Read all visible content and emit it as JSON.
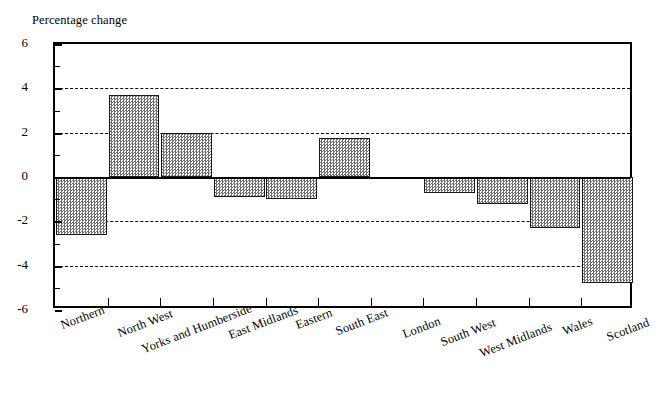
{
  "chart_data": {
    "type": "bar",
    "title": "",
    "ylabel": "Percentage change",
    "xlabel": "",
    "ylim": [
      -6,
      6
    ],
    "ytick_labels": [
      "6",
      "4",
      "2",
      "0",
      "-2",
      "-4",
      "-6"
    ],
    "ytick_values": [
      6,
      4,
      2,
      0,
      -2,
      -4,
      -6
    ],
    "yminor_ticks": [
      5,
      3,
      1,
      -1,
      -3,
      -5
    ],
    "gridlines": [
      4,
      2,
      -2,
      -4
    ],
    "grid": true,
    "grid_style": "dashed",
    "zero_line": 0,
    "legend": "none",
    "categories": [
      "Northern",
      "North West",
      "Yorks and Humberside",
      "East Midlands",
      "Eastern",
      "South East",
      "London",
      "South West",
      "West Midlands",
      "Wales",
      "Scotland"
    ],
    "values": [
      -2.6,
      3.7,
      2.0,
      -0.9,
      -1.0,
      1.75,
      -0.1,
      -0.7,
      -1.2,
      -2.3,
      -4.8
    ],
    "bar_color": "#b6b6b6",
    "bar_edge_color": "#1a1a1a",
    "bar_pattern": "checkered-dither"
  },
  "axis": {
    "y_title": "Percentage change"
  }
}
